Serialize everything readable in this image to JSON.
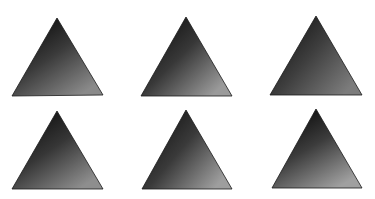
{
  "image": {
    "description": "Six dark grayscale gradient-shaded triangles arranged in a 2x3 grid on white background",
    "width": 375,
    "height": 199,
    "background": "#ffffff"
  },
  "triangles": [
    {
      "apex": [
        57,
        18
      ],
      "left": [
        12,
        96
      ],
      "right": [
        103,
        95
      ],
      "dark": "#0c0c0c",
      "mid": "#3a3a3a",
      "light": "#8a8a8a",
      "angle": 30
    },
    {
      "apex": [
        186,
        17
      ],
      "left": [
        141,
        96
      ],
      "right": [
        232,
        96
      ],
      "dark": "#101010",
      "mid": "#383838",
      "light": "#9a9a9a",
      "angle": 20
    },
    {
      "apex": [
        316,
        16
      ],
      "left": [
        270,
        95
      ],
      "right": [
        362,
        95
      ],
      "dark": "#141414",
      "mid": "#3e3e3e",
      "light": "#7c7c7c",
      "angle": 15
    },
    {
      "apex": [
        57,
        111
      ],
      "left": [
        12,
        189
      ],
      "right": [
        103,
        189
      ],
      "dark": "#0e0e0e",
      "mid": "#363636",
      "light": "#8e8e8e",
      "angle": 30
    },
    {
      "apex": [
        186,
        110
      ],
      "left": [
        142,
        189
      ],
      "right": [
        232,
        189
      ],
      "dark": "#121212",
      "mid": "#3a3a3a",
      "light": "#9e9e9e",
      "angle": 15
    },
    {
      "apex": [
        316,
        109
      ],
      "left": [
        272,
        188
      ],
      "right": [
        362,
        188
      ],
      "dark": "#0a0a0a",
      "mid": "#3c3c3c",
      "light": "#a0a0a0",
      "angle": 35
    }
  ]
}
